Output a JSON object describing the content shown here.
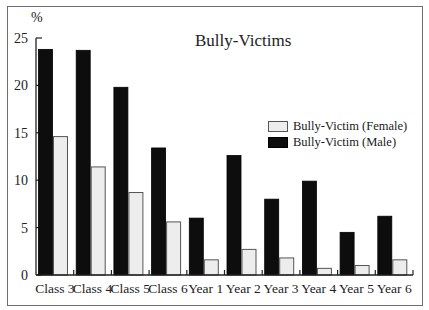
{
  "chart_data": {
    "type": "bar",
    "title": "Bully-Victims",
    "xlabel": "",
    "ylabel": "%",
    "ylim": [
      0,
      25
    ],
    "yticks": [
      0,
      5,
      10,
      15,
      20,
      25
    ],
    "grid": false,
    "legend_position": "right-middle",
    "categories": [
      "Class 3",
      "Class 4",
      "Class 5",
      "Class 6",
      "Year 1",
      "Year 2",
      "Year 3",
      "Year 4",
      "Year 5",
      "Year 6"
    ],
    "series": [
      {
        "name": "Bully-Victim (Male)",
        "color": "#0d0d0d",
        "values": [
          23.8,
          23.7,
          19.8,
          13.4,
          6.0,
          12.6,
          8.0,
          9.9,
          4.5,
          6.2
        ]
      },
      {
        "name": "Bully-Victim (Female)",
        "color": "#ededed",
        "values": [
          14.6,
          11.4,
          8.7,
          5.6,
          1.6,
          2.7,
          1.8,
          0.7,
          1.0,
          1.6
        ]
      }
    ]
  },
  "labels": {
    "title": "Bully-Victims",
    "y_unit": "%",
    "legend_female": "Bully-Victim (Female)",
    "legend_male": "Bully-Victim (Male)"
  }
}
